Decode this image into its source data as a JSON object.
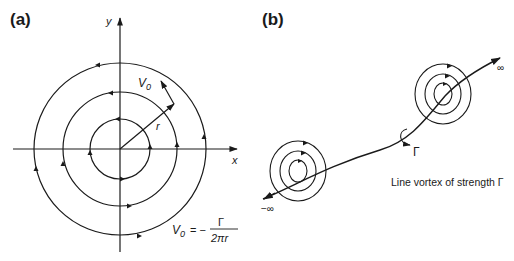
{
  "panel_a": {
    "label": "(a)",
    "axis_x": "x",
    "axis_y": "y",
    "velocity_label": "V",
    "velocity_sub": "0",
    "radius_label": "r",
    "formula": {
      "lhs": "V",
      "lhs_sub": "0",
      "eq": "= −",
      "numerator": "Γ",
      "denominator": "2πr"
    }
  },
  "panel_b": {
    "label": "(b)",
    "plus_infinity": "∞",
    "minus_infinity": "−∞",
    "gamma": "Γ",
    "caption": "Line vortex of strength Γ"
  },
  "colors": {
    "ink": "#1a1a1a",
    "background": "#ffffff"
  }
}
